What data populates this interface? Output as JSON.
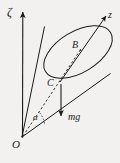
{
  "figure": {
    "kind": "physics-diagram",
    "background_color": "#f2f1ef",
    "ink_color": "#1a1a1a",
    "width": 120,
    "height": 163,
    "labels": {
      "vertical_axis": "ζ",
      "body_axis": "z",
      "base_center": "B",
      "mass_center": "C",
      "weight_vector": "mg",
      "half_angle": "α",
      "origin": "O"
    },
    "elements": [
      {
        "name": "vertical-axis-zeta",
        "type": "arrow",
        "from": [
          22,
          137
        ],
        "to": [
          23,
          10
        ]
      },
      {
        "name": "body-axis-z",
        "type": "arrow",
        "from": [
          22,
          137
        ],
        "to": [
          108,
          14
        ]
      },
      {
        "name": "cone-base-ellipse",
        "type": "ellipse",
        "center": [
          78,
          52
        ],
        "rx": 38,
        "ry": 20,
        "rotation": -30
      },
      {
        "name": "cone-generator-upper",
        "type": "line",
        "from": [
          22,
          137
        ],
        "to": [
          44,
          26
        ]
      },
      {
        "name": "cone-generator-lower",
        "type": "line",
        "from": [
          22,
          137
        ],
        "to": [
          110,
          74
        ]
      },
      {
        "name": "cone-axis-dashed",
        "type": "dashed-line",
        "from": [
          22,
          137
        ],
        "to": [
          80,
          50
        ]
      },
      {
        "name": "weight-arrow-mg",
        "type": "arrow",
        "from": [
          61,
          84
        ],
        "to": [
          61,
          118
        ]
      },
      {
        "name": "half-angle-arc",
        "type": "arc",
        "center": [
          22,
          137
        ],
        "radius": 24
      }
    ]
  }
}
